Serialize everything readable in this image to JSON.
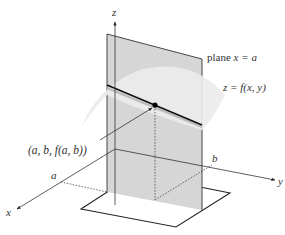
{
  "labels": {
    "z_axis": "z",
    "x_axis": "x",
    "y_axis": "y",
    "plane_word": "plane",
    "plane_eq": "x = a",
    "surface": "z = f(x, y)",
    "point": "(a, b, f(a, b))",
    "a_tick": "a",
    "b_tick": "b"
  },
  "colors": {
    "plane_fill": "#d4d4d4",
    "surface_fill": "#e8e8e8",
    "curve": "#111111",
    "axis": "#333333"
  }
}
